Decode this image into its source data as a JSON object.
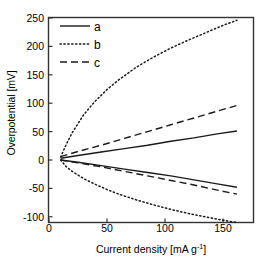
{
  "chart_data": {
    "type": "line",
    "title": "",
    "xlabel": "Current density [mA g-1]",
    "xlabel_base": "Current density [mA g",
    "xlabel_sup": "-1",
    "xlabel_tail": "]",
    "ylabel": "Overpotential [mV]",
    "xlim": [
      0,
      170
    ],
    "ylim": [
      -120,
      250
    ],
    "xticks": [
      0,
      50,
      100,
      150
    ],
    "yticks": [
      250,
      200,
      150,
      100,
      50,
      0,
      -50,
      -100
    ],
    "grid": false,
    "legend_position": "top-left",
    "series": [
      {
        "name": "a",
        "style": "solid",
        "x": [
          10,
          25,
          45,
          65,
          85,
          105,
          125,
          145,
          162
        ],
        "values": [
          3,
          8,
          14,
          20,
          26,
          33,
          39,
          46,
          51
        ]
      },
      {
        "name": "a-negative",
        "style": "solid",
        "x": [
          10,
          25,
          45,
          65,
          85,
          105,
          125,
          145,
          162
        ],
        "values": [
          0,
          -4,
          -10,
          -16,
          -22,
          -28,
          -35,
          -42,
          -48
        ]
      },
      {
        "name": "b",
        "style": "dotted",
        "x": [
          10,
          15,
          20,
          30,
          40,
          50,
          60,
          75,
          90,
          105,
          120,
          135,
          150,
          162
        ],
        "values": [
          5,
          28,
          48,
          80,
          104,
          124,
          141,
          163,
          181,
          197,
          211,
          224,
          237,
          246
        ]
      },
      {
        "name": "b-negative",
        "style": "dotted",
        "x": [
          10,
          15,
          20,
          30,
          40,
          50,
          60,
          75,
          90,
          105,
          120,
          135,
          150,
          162
        ],
        "values": [
          0,
          -12,
          -20,
          -33,
          -43,
          -52,
          -60,
          -70,
          -79,
          -87,
          -94,
          -100,
          -106,
          -110
        ]
      },
      {
        "name": "c",
        "style": "dashed",
        "x": [
          10,
          25,
          45,
          65,
          85,
          105,
          125,
          145,
          162
        ],
        "values": [
          6,
          15,
          26,
          38,
          50,
          62,
          74,
          86,
          96
        ]
      },
      {
        "name": "c-negative",
        "style": "dashed",
        "x": [
          10,
          25,
          45,
          65,
          85,
          105,
          125,
          145,
          162
        ],
        "values": [
          0,
          -5,
          -12,
          -20,
          -28,
          -36,
          -44,
          -53,
          -60
        ]
      }
    ],
    "legend": [
      {
        "label": "a",
        "style": "solid"
      },
      {
        "label": "b",
        "style": "dotted"
      },
      {
        "label": "c",
        "style": "dashed"
      }
    ],
    "colors": {
      "line": "#1a1a1a",
      "axis": "#333333",
      "background": "#ffffff",
      "text": "#000000"
    }
  }
}
